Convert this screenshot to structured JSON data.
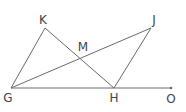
{
  "diagram": {
    "points": {
      "K": {
        "label": "K",
        "x": 45,
        "y": 28,
        "lx": 43,
        "ly": 24
      },
      "J": {
        "label": "J",
        "x": 151,
        "y": 28,
        "lx": 154,
        "ly": 24
      },
      "M": {
        "label": "M",
        "x": 81,
        "y": 59,
        "lx": 83,
        "ly": 51
      },
      "G": {
        "label": "G",
        "x": 11,
        "y": 88,
        "lx": 8,
        "ly": 102
      },
      "H": {
        "label": "H",
        "x": 114,
        "y": 88,
        "lx": 114,
        "ly": 102
      },
      "O": {
        "label": "O",
        "x": 171,
        "y": 88,
        "lx": 171,
        "ly": 103
      }
    },
    "segments": [
      [
        "G",
        "K"
      ],
      [
        "K",
        "H"
      ],
      [
        "G",
        "J"
      ],
      [
        "J",
        "H"
      ],
      [
        "G",
        "O"
      ]
    ],
    "colors": {
      "line": "#6a6a6a",
      "label": "#444444"
    }
  }
}
